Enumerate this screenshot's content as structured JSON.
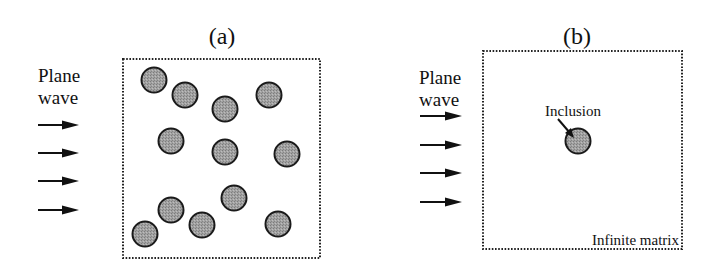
{
  "panels": [
    {
      "id": "a",
      "title": "(a)",
      "incident_label_line1": "Plane",
      "incident_label_line2": "wave",
      "arrow_count": 4,
      "inclusion_count": 12,
      "boundary": "dotted"
    },
    {
      "id": "b",
      "title": "(b)",
      "incident_label_line1": "Plane",
      "incident_label_line2": "wave",
      "arrow_count": 4,
      "inclusion_count": 1,
      "inclusion_label": "Inclusion",
      "matrix_label": "Infinite matrix",
      "boundary": "dotted"
    }
  ],
  "colors": {
    "inclusion_fill": "#9a9a9a",
    "stroke": "#1a1a1a",
    "background": "#ffffff"
  }
}
